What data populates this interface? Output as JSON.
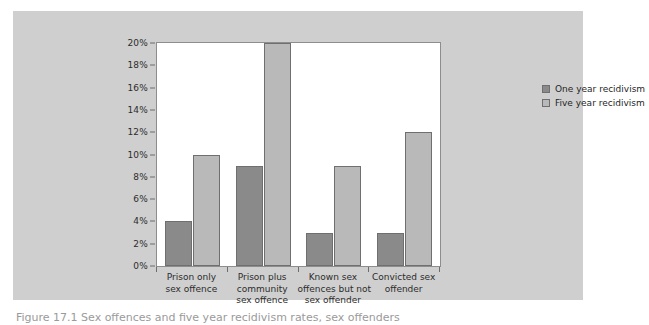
{
  "figure": {
    "background_color": "#cfcfcf",
    "plot_background_color": "#ffffff",
    "caption": "Figure 17.1  Sex offences and five year recidivism rates, sex offenders"
  },
  "legend": {
    "position": "top-right-inside",
    "items": [
      {
        "label": "One year recidivism",
        "color": "#8a8a8a"
      },
      {
        "label": "Five year recidivism",
        "color": "#b9b9b9"
      }
    ]
  },
  "axis": {
    "y_ticks": [
      "0%",
      "2%",
      "4%",
      "6%",
      "8%",
      "10%",
      "12%",
      "14%",
      "16%",
      "18%",
      "20%"
    ],
    "y_values": [
      0,
      2,
      4,
      6,
      8,
      10,
      12,
      14,
      16,
      18,
      20
    ]
  },
  "chart_data": {
    "type": "bar",
    "title": "",
    "xlabel": "",
    "ylabel": "",
    "ylim": [
      0,
      20
    ],
    "ytick_step": 2,
    "grid": false,
    "legend_position": "upper right",
    "categories": [
      "Prison only sex offence",
      "Prison plus community sex offence",
      "Known sex offences but not sex offender",
      "Convicted sex offender"
    ],
    "category_lines": [
      [
        "Prison only",
        "sex offence"
      ],
      [
        "Prison plus",
        "community",
        "sex offence"
      ],
      [
        "Known sex",
        "offences but not",
        "sex offender"
      ],
      [
        "Convicted sex",
        "offender"
      ]
    ],
    "series": [
      {
        "name": "One year recidivism",
        "color": "#8a8a8a",
        "values": [
          4,
          9,
          3,
          3
        ]
      },
      {
        "name": "Five year recidivism",
        "color": "#b9b9b9",
        "values": [
          10,
          20,
          9,
          12
        ]
      }
    ]
  }
}
